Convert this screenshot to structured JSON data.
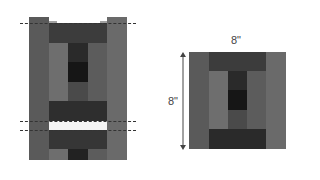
{
  "left_figure": {
    "description": "Log cabin block with side strips pulled out and cut lines",
    "colors": {
      "outer_side": "#5a5a5a",
      "outer_side_right": "#6a6a6a",
      "top_band": "#3c3c3c",
      "mid_left": "#6e6e6e",
      "center_dark": "#2a2a2a",
      "center_darkest": "#161616",
      "mid_right": "#5c5c5c",
      "bottom_band": "#2e2e2e",
      "gap": "#f4f4f4"
    }
  },
  "right_figure": {
    "width_label": "8\"",
    "height_label": "8\""
  }
}
